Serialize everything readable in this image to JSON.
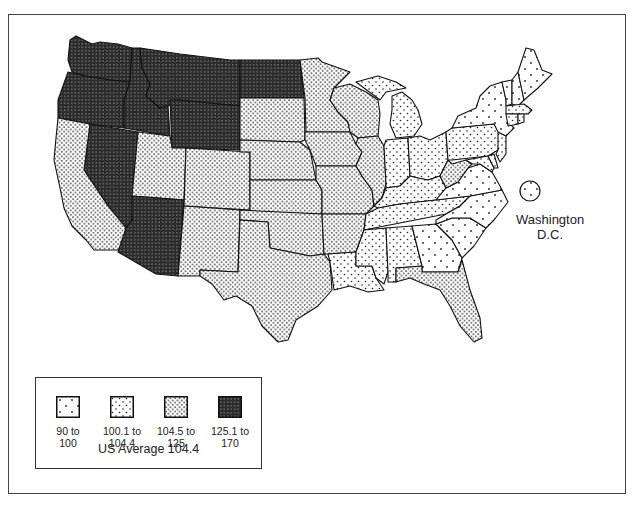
{
  "page": {
    "top_fragment": "p"
  },
  "map": {
    "type": "choropleth",
    "region": "United States",
    "patterns": {
      "cat1": {
        "name": "sparse-dots",
        "fill": "#ffffff",
        "dot": "#222222"
      },
      "cat2": {
        "name": "light-dots",
        "fill": "#ffffff",
        "dot": "#222222"
      },
      "cat3": {
        "name": "medium-dots",
        "fill": "#ffffff",
        "dot": "#333333"
      },
      "cat4": {
        "name": "dark-dense",
        "fill": "#2b2b2b",
        "dot": "#bdbdbd"
      }
    },
    "states": {
      "cat4": [
        "WA",
        "OR",
        "ID",
        "MT",
        "WY",
        "ND",
        "NV",
        "AZ"
      ],
      "cat3": [
        "CA",
        "UT",
        "CO",
        "NM",
        "TX",
        "SD",
        "NE",
        "KS",
        "OK",
        "MN",
        "IA",
        "MO",
        "AR",
        "WI",
        "IL",
        "FL",
        "WV"
      ],
      "cat2": [
        "MI",
        "IN",
        "OH",
        "KY",
        "PA",
        "LA",
        "MS",
        "AL",
        "TN",
        "NJ",
        "MD",
        "DE",
        "CT",
        "RI",
        "MA"
      ],
      "cat1": [
        "GA",
        "SC",
        "NC",
        "VA",
        "NY",
        "VT",
        "NH",
        "ME",
        "DC"
      ]
    },
    "dc": {
      "label_line1": "Washington",
      "label_line2": "D.C.",
      "category": "cat1"
    }
  },
  "legend": {
    "items": [
      {
        "id": "cat1",
        "label": "90 to\n100",
        "min": 90,
        "max": 100
      },
      {
        "id": "cat2",
        "label": "100.1 to\n104.4",
        "min": 100.1,
        "max": 104.4
      },
      {
        "id": "cat3",
        "label": "104.5 to\n125",
        "min": 104.5,
        "max": 125
      },
      {
        "id": "cat4",
        "label": "125.1 to\n170",
        "min": 125.1,
        "max": 170
      }
    ],
    "average_label": "US Average 104.4",
    "average_value": 104.4
  }
}
